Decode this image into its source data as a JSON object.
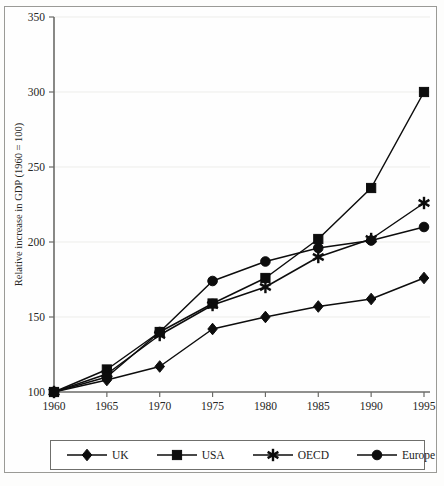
{
  "chart_data": {
    "type": "line",
    "title": "",
    "xlabel": "",
    "ylabel": "Relative increase in GDP (1960 = 100)",
    "x": [
      1960,
      1965,
      1970,
      1975,
      1980,
      1985,
      1990,
      1995
    ],
    "xtick_labels": [
      "1960",
      "1965",
      "1970",
      "1975",
      "1980",
      "1985",
      "1990",
      "1995"
    ],
    "ytick_labels": [
      "100",
      "150",
      "200",
      "250",
      "300",
      "350"
    ],
    "yticks": [
      100,
      150,
      200,
      250,
      300,
      350
    ],
    "ylim": [
      100,
      350
    ],
    "xlim": [
      1960,
      1995
    ],
    "grid": true,
    "legend_position": "below",
    "series": [
      {
        "name": "UK",
        "marker": "diamond",
        "values": [
          100,
          108,
          117,
          142,
          150,
          157,
          162,
          176
        ]
      },
      {
        "name": "USA",
        "marker": "square",
        "values": [
          100,
          115,
          140,
          159,
          176,
          202,
          236,
          300
        ]
      },
      {
        "name": "OECD",
        "marker": "star",
        "values": [
          100,
          112,
          138,
          158,
          170,
          190,
          202,
          226
        ]
      },
      {
        "name": "Europe",
        "marker": "circle",
        "values": [
          100,
          110,
          140,
          174,
          187,
          196,
          201,
          210
        ]
      }
    ]
  },
  "legend": {
    "entries": [
      {
        "label": "UK"
      },
      {
        "label": "USA"
      },
      {
        "label": "OECD"
      },
      {
        "label": "Europe"
      }
    ]
  },
  "axes": {
    "y_title": "Relative increase in GDP (1960 = 100)"
  }
}
